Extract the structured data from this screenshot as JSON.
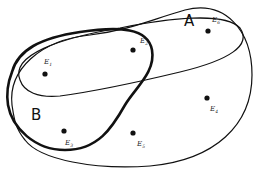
{
  "diagram": {
    "type": "set-diagram",
    "sets": [
      {
        "id": "U",
        "label": "",
        "stroke_width": 1.2
      },
      {
        "id": "A",
        "label": "A",
        "stroke_width": 1.2
      },
      {
        "id": "B",
        "label": "B",
        "stroke_width": 2.6
      }
    ],
    "points": [
      {
        "name": "E",
        "sub": "1",
        "region": "B ∩ A"
      },
      {
        "name": "E",
        "sub": "2",
        "region": "B ∩ A"
      },
      {
        "name": "E",
        "sub": "6",
        "region": "A only"
      },
      {
        "name": "E",
        "sub": "4",
        "region": "outside A and B"
      },
      {
        "name": "E",
        "sub": "5",
        "region": "outside A and B"
      },
      {
        "name": "E",
        "sub": "3",
        "region": "B only"
      }
    ],
    "colors": {
      "stroke": "#111111",
      "background": "#ffffff"
    }
  }
}
